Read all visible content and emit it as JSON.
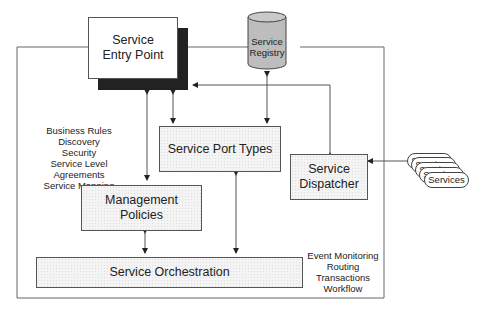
{
  "diagram": {
    "nodes": {
      "service_entry_point": {
        "label_line1": "Service",
        "label_line2": "Entry Point"
      },
      "service_registry": {
        "label_line1": "Service",
        "label_line2": "Registry"
      },
      "service_port_types": {
        "label": "Service Port Types"
      },
      "service_dispatcher": {
        "label_line1": "Service",
        "label_line2": "Dispatcher"
      },
      "management_policies": {
        "label": "Management Policies"
      },
      "service_orchestration": {
        "label": "Service Orchestration"
      },
      "services_stack": {
        "labels": [
          "Services",
          "Services",
          "Services",
          "Services",
          "Services"
        ]
      }
    },
    "annotations": {
      "policies_list": [
        "Business Rules",
        "Discovery",
        "Security",
        "Service Level Agreements",
        "Service Mapping"
      ],
      "orchestration_list": [
        "Event Monitoring",
        "Routing",
        "Transactions",
        "Workflow"
      ]
    },
    "colors": {
      "line": "#555555",
      "shadow": "#222222",
      "registry_fill": "#bdbdbd",
      "box_fill": "#f4f4f4"
    }
  }
}
